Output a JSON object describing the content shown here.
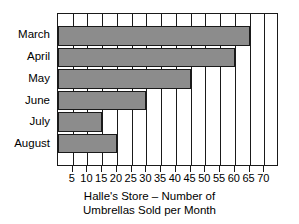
{
  "chart_data": {
    "type": "bar",
    "orientation": "horizontal",
    "title": "",
    "caption_line1": "Halle's Store – Number of",
    "caption_line2": "Umbrellas Sold per Month",
    "categories": [
      "March",
      "April",
      "May",
      "June",
      "July",
      "August"
    ],
    "values": [
      65,
      60,
      45,
      30,
      15,
      20
    ],
    "series": [
      {
        "name": "Umbrellas Sold",
        "values": [
          65,
          60,
          45,
          30,
          15,
          20
        ]
      }
    ],
    "xlabel": "",
    "ylabel": "",
    "xlim": [
      0,
      75
    ],
    "xticks": [
      5,
      10,
      15,
      20,
      25,
      30,
      35,
      40,
      45,
      50,
      55,
      60,
      65,
      70
    ],
    "xtick_labels": [
      "5",
      "10",
      "15",
      "20",
      "25",
      "30",
      "35",
      "40",
      "45",
      "50",
      "55",
      "60",
      "65",
      "70"
    ],
    "grid": true,
    "grid_axis": "x",
    "legend": false,
    "legend_position": "none",
    "bar_color": "#8c8c8c",
    "bar_edge_color": "#1a1a1a",
    "axis_color": "#1a1a1a",
    "background_color": "#ffffff"
  }
}
